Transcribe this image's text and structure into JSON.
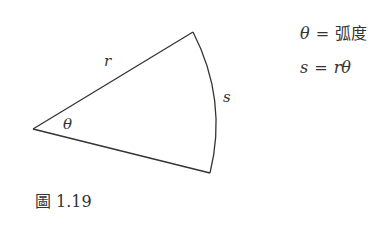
{
  "figure": {
    "caption_prefix": "圖",
    "caption_number": "1.19",
    "labels": {
      "radius": "r",
      "arc": "s",
      "angle": "θ"
    }
  },
  "formulas": [
    {
      "lhs": "θ",
      "eq": "=",
      "rhs": "弧度"
    },
    {
      "lhs": "s",
      "eq": "=",
      "rhs": "rθ"
    }
  ],
  "geometry": {
    "vertex": [
      33,
      129
    ],
    "top_point": [
      193,
      32
    ],
    "bottom_point": [
      210,
      173
    ],
    "stroke_color": "#333333"
  }
}
